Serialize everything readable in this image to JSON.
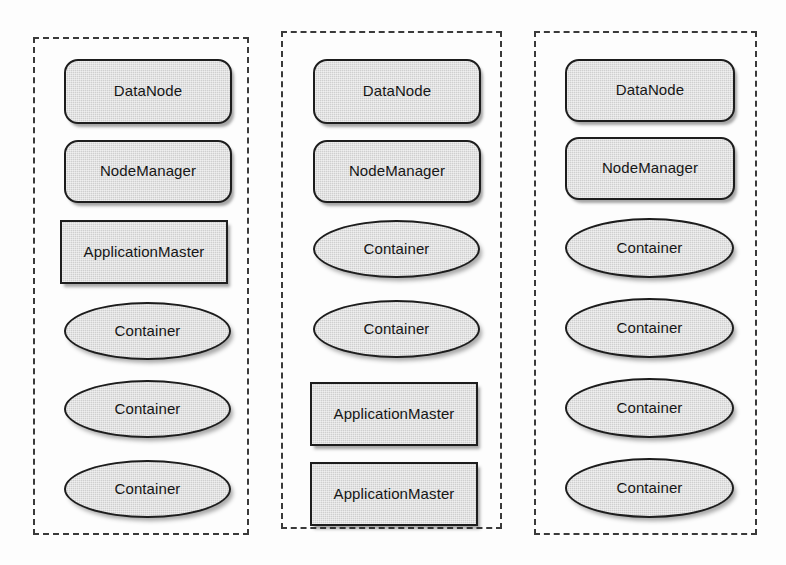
{
  "diagram": {
    "type": "yarn-cluster-nodes",
    "canvas": {
      "width": 786,
      "height": 565,
      "background": "#fdfdfd"
    },
    "style": {
      "shape_fill": "#cfcfcf",
      "shape_stroke": "#1d1d1d",
      "node_border": "#3a3a3a",
      "text_color": "#161616"
    },
    "nodes": [
      {
        "id": "node-1",
        "frame": {
          "x": 33,
          "y": 37,
          "width": 216,
          "height": 498
        },
        "shapes": [
          {
            "id": "n1-datanode",
            "label": "DataNode",
            "shape": "rounded-rect",
            "x": 29,
            "y": 20,
            "width": 168,
            "height": 65
          },
          {
            "id": "n1-nodemanager",
            "label": "NodeManager",
            "shape": "rounded-rect",
            "x": 29,
            "y": 101,
            "width": 168,
            "height": 63
          },
          {
            "id": "n1-appmaster",
            "label": "ApplicationMaster",
            "shape": "rect",
            "x": 25,
            "y": 181,
            "width": 168,
            "height": 64
          },
          {
            "id": "n1-container-1",
            "label": "Container",
            "shape": "ellipse",
            "x": 29,
            "y": 263,
            "width": 167,
            "height": 58
          },
          {
            "id": "n1-container-2",
            "label": "Container",
            "shape": "ellipse",
            "x": 29,
            "y": 341,
            "width": 167,
            "height": 58
          },
          {
            "id": "n1-container-3",
            "label": "Container",
            "shape": "ellipse",
            "x": 29,
            "y": 421,
            "width": 167,
            "height": 58
          }
        ]
      },
      {
        "id": "node-2",
        "frame": {
          "x": 281,
          "y": 31,
          "width": 221,
          "height": 498
        },
        "shapes": [
          {
            "id": "n2-datanode",
            "label": "DataNode",
            "shape": "rounded-rect",
            "x": 30,
            "y": 26,
            "width": 168,
            "height": 65
          },
          {
            "id": "n2-nodemanager",
            "label": "NodeManager",
            "shape": "rounded-rect",
            "x": 30,
            "y": 107,
            "width": 168,
            "height": 63
          },
          {
            "id": "n2-container-1",
            "label": "Container",
            "shape": "ellipse",
            "x": 30,
            "y": 187,
            "width": 167,
            "height": 58
          },
          {
            "id": "n2-container-2",
            "label": "Container",
            "shape": "ellipse",
            "x": 30,
            "y": 267,
            "width": 167,
            "height": 58
          },
          {
            "id": "n2-appmaster-1",
            "label": "ApplicationMaster",
            "shape": "rect",
            "x": 27,
            "y": 349,
            "width": 168,
            "height": 64
          },
          {
            "id": "n2-appmaster-2",
            "label": "ApplicationMaster",
            "shape": "rect",
            "x": 27,
            "y": 429,
            "width": 168,
            "height": 64
          }
        ]
      },
      {
        "id": "node-3",
        "frame": {
          "x": 534,
          "y": 31,
          "width": 223,
          "height": 504
        },
        "shapes": [
          {
            "id": "n3-datanode",
            "label": "DataNode",
            "shape": "rounded-rect",
            "x": 29,
            "y": 26,
            "width": 170,
            "height": 63
          },
          {
            "id": "n3-nodemanager",
            "label": "NodeManager",
            "shape": "rounded-rect",
            "x": 29,
            "y": 104,
            "width": 170,
            "height": 63
          },
          {
            "id": "n3-container-1",
            "label": "Container",
            "shape": "ellipse",
            "x": 29,
            "y": 185,
            "width": 169,
            "height": 60
          },
          {
            "id": "n3-container-2",
            "label": "Container",
            "shape": "ellipse",
            "x": 29,
            "y": 265,
            "width": 169,
            "height": 60
          },
          {
            "id": "n3-container-3",
            "label": "Container",
            "shape": "ellipse",
            "x": 29,
            "y": 345,
            "width": 169,
            "height": 60
          },
          {
            "id": "n3-container-4",
            "label": "Container",
            "shape": "ellipse",
            "x": 29,
            "y": 425,
            "width": 169,
            "height": 60
          }
        ]
      }
    ]
  }
}
